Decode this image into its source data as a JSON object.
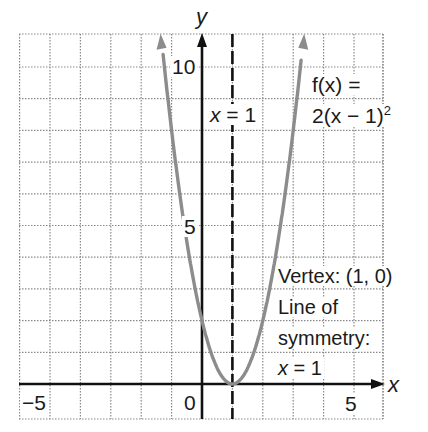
{
  "chart_data": {
    "type": "line",
    "title": "",
    "function_label_line1": "f(x) =",
    "function_label_line2": "2(x − 1)",
    "function_label_exponent": "2",
    "equation": "f(x) = 2(x - 1)^2",
    "xlabel": "x",
    "ylabel": "y",
    "xlim": [
      -6,
      6
    ],
    "ylim": [
      -1.1,
      11
    ],
    "grid": true,
    "grid_style": "dotted",
    "x_ticks_labeled": [
      {
        "value": -5,
        "label": "−5"
      },
      {
        "value": 0,
        "label": "0"
      },
      {
        "value": 5,
        "label": "5"
      }
    ],
    "y_ticks_labeled": [
      {
        "value": 5,
        "label": "5"
      },
      {
        "value": 10,
        "label": "10"
      }
    ],
    "series": [
      {
        "name": "f(x) = 2(x − 1)^2",
        "color": "#8c8c8c",
        "x": [
          -1.35,
          -1,
          -0.5,
          0,
          0.5,
          1,
          1.5,
          2,
          2.5,
          3,
          3.35
        ],
        "y": [
          11.0,
          8,
          4.5,
          2,
          0.5,
          0,
          0.5,
          2,
          4.5,
          8,
          11.0
        ]
      }
    ],
    "axis_of_symmetry": {
      "x": 1,
      "label": "x = 1",
      "style": "dashed"
    },
    "annotations": {
      "vertex": "Vertex: (1, 0)",
      "line_of": "Line of",
      "symmetry": "symmetry:",
      "symmetry_eq": "x = 1"
    }
  }
}
